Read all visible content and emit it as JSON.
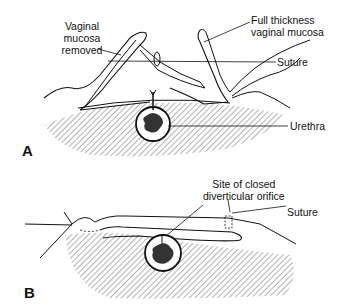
{
  "panels": [
    {
      "letter": "A",
      "labels": {
        "vaginal_mucosa_removed_1": "Vaginal",
        "vaginal_mucosa_removed_2": "mucosa",
        "vaginal_mucosa_removed_3": "removed",
        "full_thickness_1": "Full thickness",
        "full_thickness_2": "vaginal mucosa",
        "suture": "Suture",
        "urethra": "Urethra"
      }
    },
    {
      "letter": "B",
      "labels": {
        "site_1": "Site of closed",
        "site_2": "diverticular orifice",
        "suture": "Suture"
      }
    }
  ],
  "colors": {
    "ink": "#111111",
    "hatch": "#555555",
    "lumen": "#333333"
  }
}
